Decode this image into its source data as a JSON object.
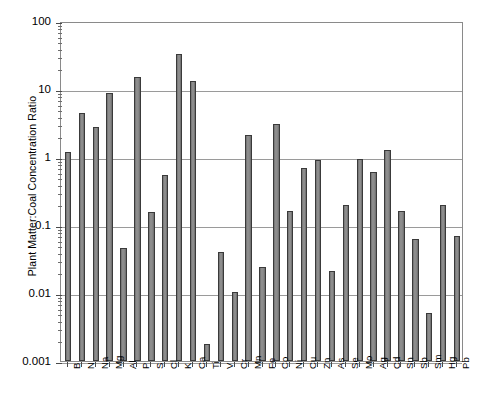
{
  "chart_data": {
    "type": "bar",
    "title": "",
    "xlabel": "",
    "ylabel": "Plant Matter:Coal Concentration Ratio",
    "yscale": "log",
    "ylim": [
      0.001,
      100
    ],
    "ytick_labels": [
      "100",
      "10",
      "1",
      "0.1",
      "0.01",
      "0.001"
    ],
    "ytick_values": [
      100,
      10,
      1,
      0.1,
      0.01,
      0.001
    ],
    "grid": true,
    "legend": null,
    "bar_color": "#808080",
    "bar_edge_color": "#333333",
    "frame_color": "#8a8a8a",
    "categories": [
      "B",
      "N",
      "Na",
      "Mg",
      "Al",
      "P",
      "S",
      "Cl",
      "K",
      "Ca",
      "Ti",
      "V",
      "Cr",
      "Mn",
      "Fe",
      "Co",
      "Ni",
      "Cu",
      "Zn",
      "As",
      "Se",
      "Mo",
      "Ag",
      "Cd",
      "Sn",
      "Sb",
      "Sm",
      "Hg",
      "Pb"
    ],
    "values": [
      1.2,
      4.4,
      2.8,
      8.8,
      0.046,
      15,
      0.155,
      0.55,
      33,
      13,
      0.0018,
      0.04,
      0.0103,
      2.1,
      0.024,
      3.1,
      0.16,
      0.68,
      0.9,
      0.021,
      0.2,
      0.93,
      0.6,
      1.25,
      0.16,
      0.063,
      0.005,
      0.2,
      0.07
    ]
  }
}
